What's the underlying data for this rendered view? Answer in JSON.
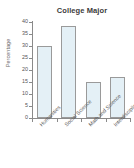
{
  "chart_data": {
    "type": "bar",
    "title": "College Major",
    "xlabel": "",
    "ylabel": "Percentage",
    "categories": [
      "Humanities",
      "Social Science",
      "Math and Science",
      "Interdisciplinary"
    ],
    "values": [
      30,
      38.5,
      15,
      17
    ],
    "ylim": [
      0,
      40
    ],
    "ytick_labels": [
      "0",
      "5",
      "10",
      "15",
      "20",
      "25",
      "30",
      "35",
      "40"
    ],
    "ytick_values": [
      0,
      5,
      10,
      15,
      20,
      25,
      30,
      35,
      40
    ],
    "grid": false,
    "legend": null,
    "colors": {
      "bar_fill": "#e4f0f6",
      "bar_border": "#9a9a9a",
      "axis": "#8a8a8a",
      "title_text": "#3b3b3b",
      "tick_text": "#555555",
      "background": "#ffffff"
    }
  }
}
